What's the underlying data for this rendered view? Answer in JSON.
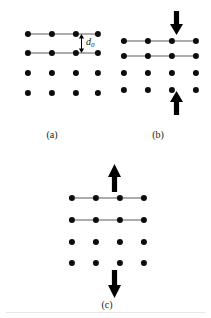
{
  "figure": {
    "background_color": "#ffffff",
    "dot_color": "#0d0d0d",
    "bond_color": "#5a5a5a",
    "arrow_color": "#000000",
    "width": 211,
    "height": 318,
    "caption_labels": {
      "a": "(a)",
      "b": "(b)",
      "c": "(c)"
    },
    "dimension_label": {
      "symbol": "d",
      "subscript": "0",
      "full_text": "d0",
      "meaning": "equilibrium interlayer spacing"
    }
  },
  "panels": [
    {
      "id": "a",
      "label": "(a)",
      "label_x": 52,
      "label_y": 130,
      "origin_x": 8,
      "origin_y": 0,
      "state": "equilibrium",
      "rows": [
        {
          "y": 34,
          "xs": [
            20,
            44,
            68,
            90
          ],
          "chained": true
        },
        {
          "y": 53,
          "xs": [
            20,
            44,
            68,
            90
          ],
          "chained": true
        },
        {
          "y": 73,
          "xs": [
            20,
            44,
            68,
            90
          ],
          "chained": false
        },
        {
          "y": 93,
          "xs": [
            20,
            44,
            68,
            90
          ],
          "chained": false
        }
      ],
      "annotation": {
        "type": "dimension-arrow",
        "x": 73,
        "y_top": 34,
        "y_bottom": 53,
        "label_x": 78,
        "label_y": 37
      },
      "arrows": []
    },
    {
      "id": "b",
      "label": "(b)",
      "label_x": 158,
      "label_y": 130,
      "origin_x": 112,
      "origin_y": 0,
      "state": "compressed",
      "rows": [
        {
          "y": 41,
          "xs": [
            12,
            36,
            60,
            84
          ],
          "chained": true
        },
        {
          "y": 56,
          "xs": [
            12,
            36,
            60,
            84
          ],
          "chained": true
        },
        {
          "y": 73,
          "xs": [
            12,
            36,
            60,
            84
          ],
          "chained": false
        },
        {
          "y": 90,
          "xs": [
            12,
            36,
            60,
            84
          ],
          "chained": false
        }
      ],
      "annotation": null,
      "arrows": [
        {
          "direction": "down",
          "x": 58,
          "y": 11,
          "length": 24,
          "position": "top",
          "meaning": "applied compressive force inward"
        },
        {
          "direction": "up",
          "x": 58,
          "y": 91,
          "length": 24,
          "position": "bottom",
          "meaning": "applied compressive force inward"
        }
      ]
    },
    {
      "id": "c",
      "label": "(c)",
      "label_x": 107,
      "label_y": 300,
      "origin_x": 56,
      "origin_y": 160,
      "state": "expanded",
      "rows": [
        {
          "y": 38,
          "xs": [
            16,
            40,
            64,
            88
          ],
          "chained": true
        },
        {
          "y": 60,
          "xs": [
            16,
            40,
            64,
            88
          ],
          "chained": true
        },
        {
          "y": 82,
          "xs": [
            16,
            40,
            64,
            88
          ],
          "chained": false
        },
        {
          "y": 103,
          "xs": [
            16,
            40,
            64,
            88
          ],
          "chained": false
        }
      ],
      "annotation": null,
      "arrows": [
        {
          "direction": "up",
          "x": 52,
          "y": 4,
          "length": 28,
          "position": "top",
          "meaning": "applied tensile force outward"
        },
        {
          "direction": "down",
          "x": 52,
          "y": 110,
          "length": 28,
          "position": "bottom",
          "meaning": "applied tensile force outward"
        }
      ]
    }
  ]
}
